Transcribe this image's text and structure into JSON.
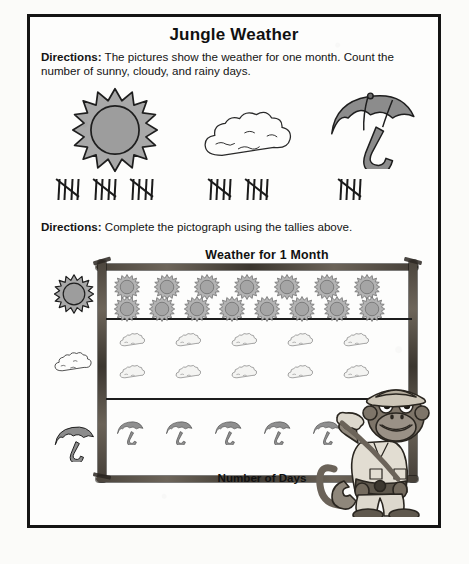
{
  "worksheet": {
    "title": "Jungle Weather",
    "directions_1_label": "Directions:",
    "directions_1_text": " The pictures show the weather for one month. Count the number of sunny, cloudy, and rainy days.",
    "directions_2_label": "Directions:",
    "directions_2_text": " Complete the pictograph using the tallies above."
  },
  "illustrations": [
    {
      "name": "sun",
      "label": "sunny"
    },
    {
      "name": "cloud",
      "label": "cloudy"
    },
    {
      "name": "umbrella",
      "label": "rainy"
    }
  ],
  "tallies": [
    {
      "category": "sunny",
      "groups_of_five": 3,
      "total": 15
    },
    {
      "category": "cloudy",
      "groups_of_five": 2,
      "total": 10
    },
    {
      "category": "rainy",
      "groups_of_five": 1,
      "total": 5
    }
  ],
  "chart_data": {
    "type": "bar",
    "title": "Weather for 1 Month",
    "xlabel": "Number of Days",
    "ylabel": "",
    "categories": [
      "sunny",
      "cloudy",
      "rainy"
    ],
    "values": [
      15,
      10,
      5
    ],
    "icon_per_row": {
      "sunny": [
        7,
        8
      ],
      "cloudy": [
        5,
        5
      ],
      "rainy": [
        5
      ]
    },
    "symbol_value": 1,
    "grid": true,
    "legend": "none",
    "xlim": [
      0,
      15
    ]
  },
  "mascot": {
    "name": "jungle-explorer-monkey"
  },
  "colors": {
    "ink": "#141414",
    "sun_fill": "#9a9a9a",
    "cloud_fill": "#fdfdfc",
    "umbrella_fill": "#8a8a8a",
    "pole": "#5a5349"
  }
}
